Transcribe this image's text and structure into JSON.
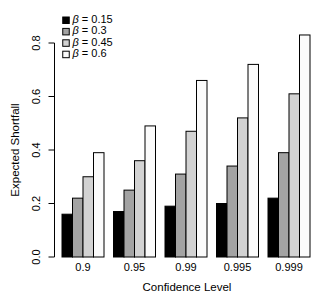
{
  "figure": {
    "background": "#ffffff"
  },
  "chart_data": {
    "type": "bar",
    "title": "",
    "xlabel": "Confidence Level",
    "ylabel": "Expected Shortfall",
    "categories": [
      "0.9",
      "0.95",
      "0.99",
      "0.995",
      "0.999"
    ],
    "series": [
      {
        "name": "β = 0.15",
        "color": "#000000",
        "values": [
          0.16,
          0.17,
          0.19,
          0.2,
          0.22
        ]
      },
      {
        "name": "β = 0.3",
        "color": "#a3a3a3",
        "values": [
          0.22,
          0.25,
          0.31,
          0.34,
          0.39
        ]
      },
      {
        "name": "β = 0.45",
        "color": "#d2d2d2",
        "values": [
          0.3,
          0.36,
          0.47,
          0.52,
          0.61
        ]
      },
      {
        "name": "β = 0.6",
        "color": "#fbfbfb",
        "values": [
          0.39,
          0.49,
          0.66,
          0.72,
          0.83
        ]
      }
    ],
    "ylim": [
      0,
      0.8
    ],
    "yticks": [
      "0.0",
      "0.2",
      "0.4",
      "0.6",
      "0.8"
    ],
    "grid": false,
    "legend_position": "top-left",
    "bar_border_color": "#000000",
    "axis_color": "#000000"
  }
}
